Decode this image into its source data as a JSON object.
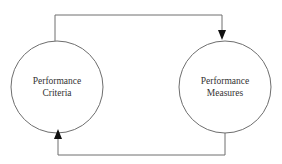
{
  "diagram": {
    "type": "feedback-loop",
    "nodes": [
      {
        "id": "criteria",
        "shape": "circle",
        "label_lines": [
          "Performance",
          "Criteria"
        ]
      },
      {
        "id": "measures",
        "shape": "circle",
        "label_lines": [
          "Performance",
          "Measures"
        ]
      }
    ],
    "edges": [
      {
        "from": "criteria",
        "to": "measures",
        "route": "top",
        "arrow_at": "measures"
      },
      {
        "from": "measures",
        "to": "criteria",
        "route": "bottom",
        "arrow_at": "criteria"
      }
    ],
    "colors": {
      "stroke": "#6e6e6e",
      "arrow": "#111111",
      "text": "#333333",
      "background": "#ffffff"
    }
  }
}
